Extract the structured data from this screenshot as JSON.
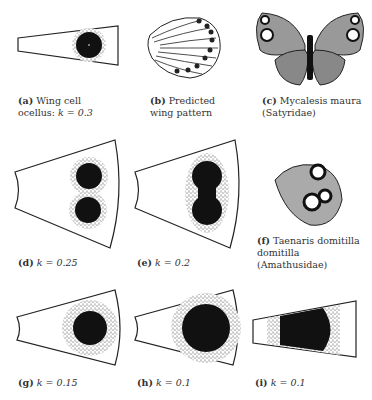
{
  "figure": {
    "panels": [
      {
        "id": "a",
        "label": "(a)",
        "line1": "Wing cell",
        "line2": "ocellus: ",
        "k": "k = 0.3"
      },
      {
        "id": "b",
        "label": "(b)",
        "line1": "Predicted",
        "line2": "wing pattern"
      },
      {
        "id": "c",
        "label": "(c)",
        "line1": "Mycalesis maura",
        "line2": "(Satyridae)"
      },
      {
        "id": "d",
        "label": "(d)",
        "k": "k = 0.25"
      },
      {
        "id": "e",
        "label": "(e)",
        "k": "k = 0.2"
      },
      {
        "id": "f",
        "label": "(f)",
        "line1": "Taenaris domitilla",
        "line2": "domitilla (Amathusidae)"
      },
      {
        "id": "g",
        "label": "(g)",
        "k": "k = 0.15"
      },
      {
        "id": "h",
        "label": "(h)",
        "k": "k = 0.1"
      },
      {
        "id": "i",
        "label": "(i)",
        "k": "k = 0.1"
      }
    ]
  }
}
